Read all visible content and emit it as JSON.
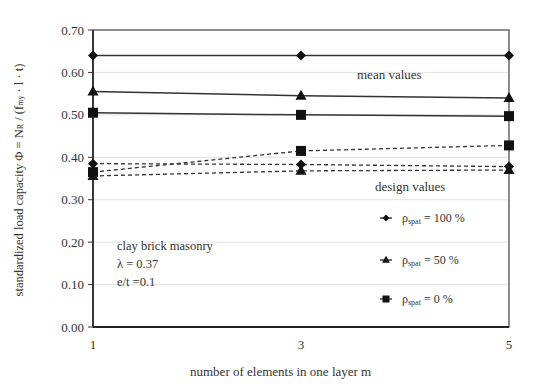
{
  "chart_data": {
    "type": "line",
    "title": "",
    "xlabel": "number of elements in one layer m",
    "ylabel": "standardized load capacity Φ = N_R / (f_my · l · t)",
    "ylabel_parts": {
      "prefix": "standardized load capacity  Φ = N",
      "sub1": "R",
      "mid": " / (f",
      "sub2": "my",
      "suffix": " · l · t)"
    },
    "x": [
      1,
      3,
      5
    ],
    "x_ticks": [
      "1",
      "3",
      "5"
    ],
    "y_ticks": [
      "0.00",
      "0.10",
      "0.20",
      "0.30",
      "0.40",
      "0.50",
      "0.60",
      "0.70"
    ],
    "ylim": [
      0.0,
      0.7
    ],
    "grid": "horizontal, faint",
    "series": [
      {
        "name": "ρspat = 100 % (mean)",
        "group": "mean values",
        "marker": "diamond",
        "line": "solid",
        "values": [
          0.64,
          0.64,
          0.64
        ]
      },
      {
        "name": "ρspat = 50 % (mean)",
        "group": "mean values",
        "marker": "triangle",
        "line": "solid",
        "values": [
          0.555,
          0.545,
          0.54
        ]
      },
      {
        "name": "ρspat = 0 % (mean)",
        "group": "mean values",
        "marker": "square",
        "line": "solid",
        "values": [
          0.505,
          0.5,
          0.497
        ]
      },
      {
        "name": "ρspat = 0 % (design)",
        "group": "design values",
        "marker": "square",
        "line": "dashed",
        "values": [
          0.365,
          0.415,
          0.428
        ]
      },
      {
        "name": "ρspat = 100 % (design)",
        "group": "design values",
        "marker": "diamond",
        "line": "dashed",
        "values": [
          0.385,
          0.383,
          0.378
        ]
      },
      {
        "name": "ρspat = 50 % (design)",
        "group": "design values",
        "marker": "triangle",
        "line": "dashed",
        "values": [
          0.356,
          0.368,
          0.37
        ]
      }
    ],
    "legend": {
      "position": "lower right, inside",
      "entries": [
        {
          "marker": "diamond",
          "label_main": "ρ",
          "label_sub": "spat",
          "label_rest": " = 100 %"
        },
        {
          "marker": "triangle",
          "label_main": "ρ",
          "label_sub": "spat",
          "label_rest": " = 50 %"
        },
        {
          "marker": "square",
          "label_main": "ρ",
          "label_sub": "spat",
          "label_rest": " = 0 %"
        }
      ]
    },
    "annotations": {
      "mean_values": "mean values",
      "design_values": "design values",
      "info_line1": "clay brick masonry",
      "info_line2": "λ = 0.37",
      "info_line3": "e/t =0.1"
    }
  }
}
